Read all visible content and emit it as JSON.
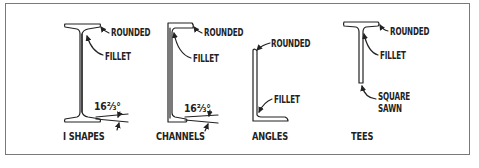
{
  "figure": {
    "shapes": [
      {
        "id": "i-shapes",
        "caption": "I SHAPES",
        "callouts": [
          "ROUNDED",
          "FILLET"
        ],
        "flange_slope": "16⅔°"
      },
      {
        "id": "channels",
        "caption": "CHANNELS",
        "callouts": [
          "ROUNDED",
          "FILLET"
        ],
        "flange_slope": "16⅔°"
      },
      {
        "id": "angles",
        "caption": "ANGLES",
        "callouts": [
          "ROUNDED",
          "FILLET"
        ]
      },
      {
        "id": "tees",
        "caption": "TEES",
        "callouts": [
          "ROUNDED",
          "FILLET",
          "SQUARE",
          "SAWN"
        ]
      }
    ]
  },
  "colors": {
    "ink": "#222222",
    "frame": "#7a7a7a",
    "background": "#ffffff"
  }
}
